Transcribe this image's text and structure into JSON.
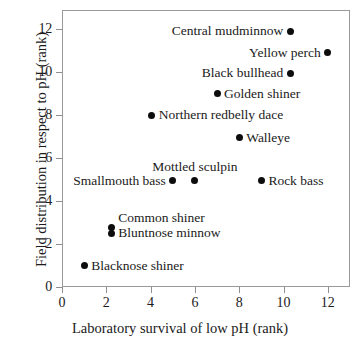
{
  "chart_data": {
    "type": "scatter",
    "title": "",
    "xlabel": "Laboratory survival of low pH (rank)",
    "ylabel": "Field distribution in respect to pH (rank)",
    "xlim": [
      0,
      13
    ],
    "ylim": [
      0,
      12.9
    ],
    "xticks": [
      0,
      2,
      4,
      6,
      8,
      10,
      12
    ],
    "yticks": [
      0,
      2,
      4,
      6,
      8,
      10,
      12
    ],
    "xticklabels": [
      "0",
      "2",
      "4",
      "6",
      "8",
      "10",
      "12"
    ],
    "yticklabels": [
      "0",
      "2",
      "4",
      "6",
      "8",
      "10",
      "12"
    ],
    "grid": false,
    "legend": false,
    "marker": "filled-circle",
    "marker_color": "#0d0d0d",
    "points": [
      {
        "label": "Central mudminnow",
        "x": 10.3,
        "y": 11.9,
        "label_pos": "left"
      },
      {
        "label": "Yellow perch",
        "x": 12.0,
        "y": 10.9,
        "label_pos": "left"
      },
      {
        "label": "Black bullhead",
        "x": 10.3,
        "y": 9.95,
        "label_pos": "left"
      },
      {
        "label": "Golden shiner",
        "x": 7.0,
        "y": 9.0,
        "label_pos": "right"
      },
      {
        "label": "Northern redbelly dace",
        "x": 4.05,
        "y": 8.0,
        "label_pos": "right"
      },
      {
        "label": "Walleye",
        "x": 8.0,
        "y": 6.95,
        "label_pos": "right"
      },
      {
        "label": "Mottled sculpin",
        "x": 6.0,
        "y": 4.95,
        "label_pos": "above"
      },
      {
        "label": "Smallmouth bass",
        "x": 5.0,
        "y": 4.95,
        "label_pos": "left"
      },
      {
        "label": "Rock bass",
        "x": 9.0,
        "y": 4.95,
        "label_pos": "right"
      },
      {
        "label": "Common shiner",
        "x": 2.22,
        "y": 2.78,
        "label_pos": "upper-right"
      },
      {
        "label": "Bluntnose minnow",
        "x": 2.22,
        "y": 2.5,
        "label_pos": "right"
      },
      {
        "label": "Blacknose shiner",
        "x": 1.0,
        "y": 1.0,
        "label_pos": "right"
      }
    ]
  },
  "axes": {
    "x_title": "Laboratory survival of low pH (rank)",
    "y_title": "Field distribution in respect to pH (rank)"
  }
}
